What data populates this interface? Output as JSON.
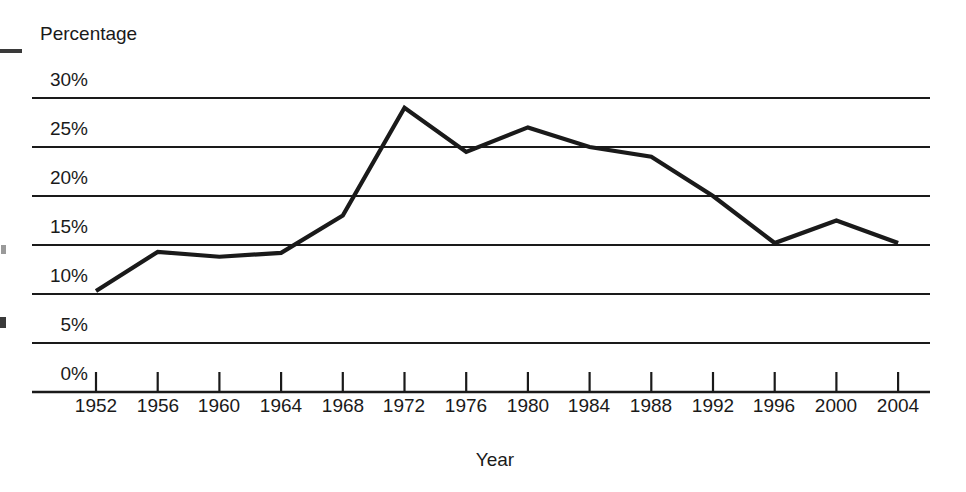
{
  "figure": {
    "y_axis_title": "Percentage",
    "x_axis_title": "Year"
  },
  "colors": {
    "line": "#1a1a1a",
    "grid": "#1a1a1a",
    "axis": "#1a1a1a",
    "text": "#1a1a1a",
    "background": "#ffffff"
  },
  "y_ticks": [
    {
      "label": "30%"
    },
    {
      "label": "25%"
    },
    {
      "label": "20%"
    },
    {
      "label": "15%"
    },
    {
      "label": "10%"
    },
    {
      "label": "5%"
    },
    {
      "label": "0%"
    }
  ],
  "x_ticks": [
    {
      "label": "1952"
    },
    {
      "label": "1956"
    },
    {
      "label": "1960"
    },
    {
      "label": "1964"
    },
    {
      "label": "1968"
    },
    {
      "label": "1972"
    },
    {
      "label": "1976"
    },
    {
      "label": "1980"
    },
    {
      "label": "1984"
    },
    {
      "label": "1988"
    },
    {
      "label": "1992"
    },
    {
      "label": "1996"
    },
    {
      "label": "2000"
    },
    {
      "label": "2004"
    }
  ],
  "chart_data": {
    "type": "line",
    "title": "",
    "subtitle": "",
    "xlabel": "Year",
    "ylabel": "Percentage",
    "x": [
      1952,
      1956,
      1960,
      1964,
      1968,
      1972,
      1976,
      1980,
      1984,
      1988,
      1992,
      1996,
      2000,
      2004
    ],
    "values": [
      10.3,
      14.3,
      13.8,
      14.2,
      18.0,
      29.0,
      24.5,
      27.0,
      25.0,
      24.0,
      20.0,
      15.2,
      17.5,
      15.2
    ],
    "categories": [
      "1952",
      "1956",
      "1960",
      "1964",
      "1968",
      "1972",
      "1976",
      "1980",
      "1984",
      "1988",
      "1992",
      "1996",
      "2000",
      "2004"
    ],
    "xlim": [
      1952,
      2004
    ],
    "ylim": [
      0,
      30
    ],
    "ytick_values": [
      30,
      25,
      20,
      15,
      10,
      5,
      0
    ],
    "ytick_labels": [
      "30%",
      "25%",
      "20%",
      "15%",
      "10%",
      "5%",
      "0%"
    ],
    "grid": "horizontal",
    "legend": "none",
    "series": [
      {
        "name": "Percentage",
        "values": [
          10.3,
          14.3,
          13.8,
          14.2,
          18.0,
          29.0,
          24.5,
          27.0,
          25.0,
          24.0,
          20.0,
          15.2,
          17.5,
          15.2
        ]
      }
    ]
  }
}
